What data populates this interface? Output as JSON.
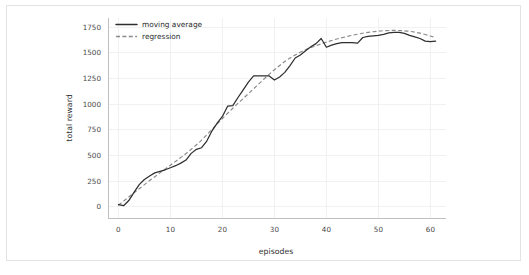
{
  "figure": {
    "background_color": "#ffffff",
    "border_color": "#e3e3e3",
    "width": 529,
    "height": 275
  },
  "chart_data": {
    "type": "line",
    "title": "",
    "xlabel": "episodes",
    "ylabel": "total reward",
    "xlim": [
      -2.0,
      63.0
    ],
    "ylim": [
      -110,
      1840
    ],
    "xticks": [
      0,
      10,
      20,
      30,
      40,
      50,
      60
    ],
    "xtick_labels": [
      "0",
      "10",
      "20",
      "30",
      "40",
      "50",
      "60"
    ],
    "yticks": [
      0,
      250,
      500,
      750,
      1000,
      1250,
      1500,
      1750
    ],
    "ytick_labels": [
      "0",
      "250",
      "500",
      "750",
      "1000",
      "1250",
      "1500",
      "1750"
    ],
    "grid": true,
    "grid_color": "#eceef0",
    "legend_position": "upper left",
    "series": [
      {
        "name": "moving average",
        "style": "solid",
        "color": "#2f2f2f",
        "x": [
          0,
          1,
          2,
          3,
          4,
          5,
          6,
          7,
          8,
          9,
          10,
          11,
          12,
          13,
          14,
          15,
          16,
          17,
          18,
          19,
          20,
          21,
          22,
          23,
          24,
          25,
          26,
          27,
          28,
          29,
          30,
          31,
          32,
          33,
          34,
          35,
          36,
          37,
          38,
          39,
          40,
          41,
          42,
          43,
          44,
          45,
          46,
          47,
          48,
          49,
          50,
          51,
          52,
          53,
          54,
          55,
          56,
          57,
          58,
          59,
          60,
          61
        ],
        "values": [
          20,
          10,
          60,
          140,
          215,
          265,
          300,
          330,
          345,
          360,
          380,
          400,
          425,
          455,
          520,
          560,
          575,
          640,
          740,
          815,
          880,
          980,
          985,
          1065,
          1140,
          1215,
          1275,
          1275,
          1275,
          1275,
          1235,
          1265,
          1310,
          1375,
          1450,
          1480,
          1520,
          1560,
          1590,
          1640,
          1555,
          1575,
          1590,
          1600,
          1600,
          1600,
          1595,
          1650,
          1660,
          1665,
          1670,
          1680,
          1695,
          1700,
          1700,
          1690,
          1670,
          1655,
          1640,
          1615,
          1610,
          1615
        ]
      },
      {
        "name": "regression",
        "style": "dashed",
        "color": "#8a8a8a",
        "x": [
          0,
          2,
          4,
          6,
          8,
          10,
          12,
          14,
          16,
          18,
          20,
          22,
          24,
          26,
          28,
          30,
          32,
          34,
          36,
          38,
          40,
          42,
          44,
          46,
          48,
          50,
          52,
          54,
          56,
          58,
          60,
          61
        ],
        "values": [
          15,
          95,
          175,
          255,
          330,
          405,
          480,
          560,
          650,
          755,
          860,
          960,
          1055,
          1150,
          1245,
          1335,
          1415,
          1480,
          1530,
          1570,
          1605,
          1635,
          1660,
          1682,
          1700,
          1712,
          1718,
          1718,
          1710,
          1692,
          1665,
          1648
        ]
      }
    ]
  },
  "legend": {
    "entries": [
      {
        "label": "moving average",
        "style": "solid",
        "color": "#2f2f2f"
      },
      {
        "label": "regression",
        "style": "dashed",
        "color": "#8a8a8a"
      }
    ]
  }
}
